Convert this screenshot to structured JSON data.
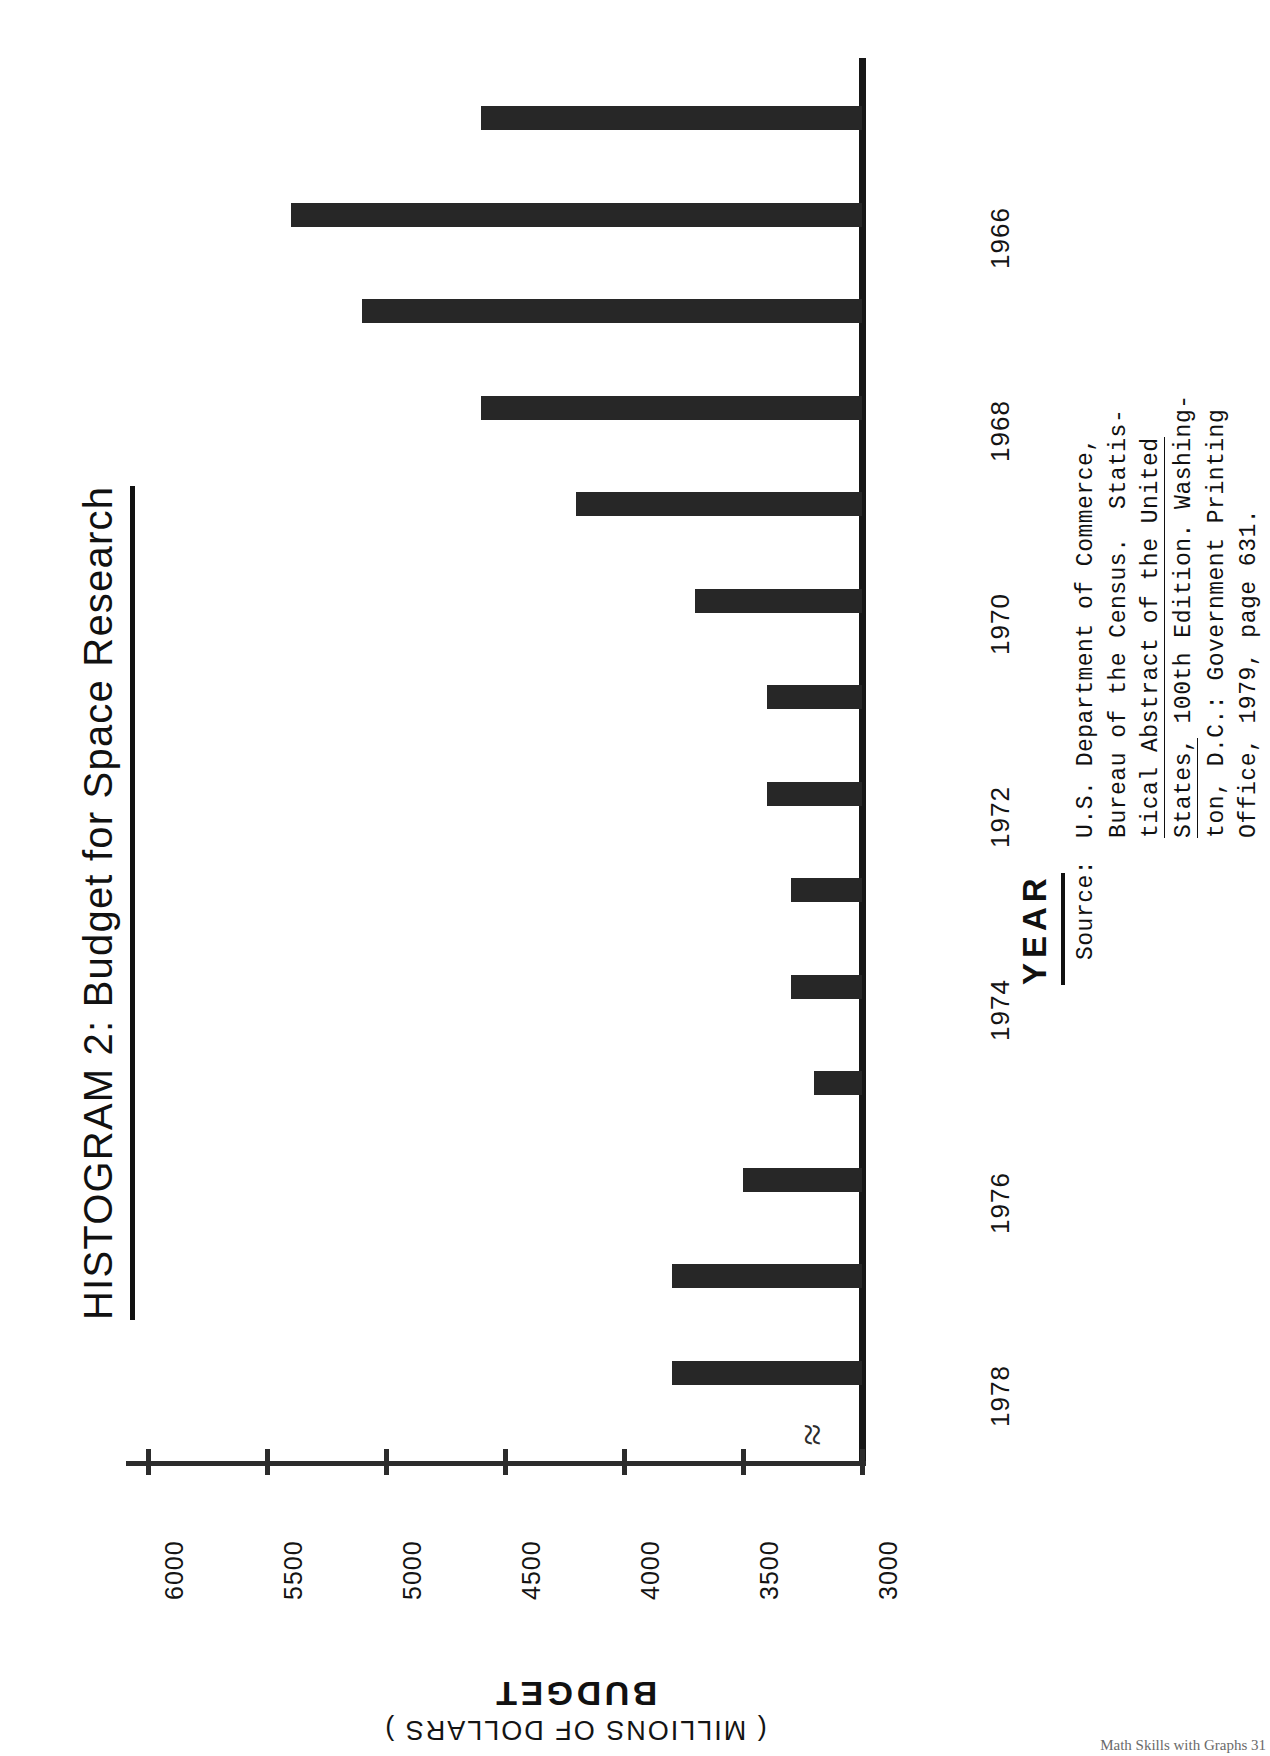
{
  "figure": {
    "title": "HISTOGRAM 2: Budget for Space Research",
    "orientation": "page-rotated-90"
  },
  "axes": {
    "value_axis_title_main": "BUDGET",
    "value_axis_title_units": "( MILLIONS OF DOLLARS )",
    "category_axis_title": "YEAR",
    "value_ticks": [
      "6000",
      "5500",
      "5000",
      "4500",
      "4000",
      "3500",
      "3000"
    ],
    "category_ticks": [
      "1966",
      "1968",
      "1970",
      "1972",
      "1974",
      "1976",
      "1978"
    ],
    "axis_break_symbol": "≈"
  },
  "source": {
    "label": "Source:",
    "lines": [
      "U.S. Department of Commerce,",
      "Bureau of the Census.  Statis-",
      "tical Abstract of the United",
      "States, 100th Edition. Washing-",
      "ton, D.C.: Government Printing",
      "Office, 1979, page 631."
    ]
  },
  "footer": "Math Skills with Graphs    31",
  "colors": {
    "bar": "#272727",
    "axis": "#2c2c2c",
    "text": "#141414",
    "background": "#ffffff"
  },
  "chart_data": {
    "type": "bar",
    "title": "HISTOGRAM 2: Budget for Space Research",
    "xlabel": "YEAR",
    "ylabel": "BUDGET ( MILLIONS OF DOLLARS )",
    "orientation": "horizontal",
    "xlim": [
      3000,
      6000
    ],
    "grid": false,
    "legend": null,
    "axis_break_at": 3000,
    "categories": [
      "1965",
      "1966",
      "1967",
      "1968",
      "1969",
      "1970",
      "1971",
      "1972",
      "1973",
      "1974",
      "1975",
      "1976",
      "1977",
      "1978"
    ],
    "values": [
      4600,
      5400,
      5100,
      4600,
      4200,
      3700,
      3400,
      3400,
      3300,
      3300,
      3200,
      3500,
      3800,
      3800
    ],
    "labeled_categories": [
      "1966",
      "1968",
      "1970",
      "1972",
      "1974",
      "1976",
      "1978"
    ]
  }
}
